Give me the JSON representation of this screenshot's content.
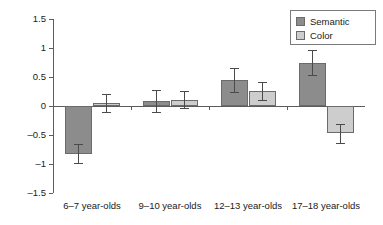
{
  "chart_data": {
    "type": "bar",
    "title": "",
    "xlabel": "",
    "ylabel": "Z scores",
    "ylim": [
      -1.5,
      1.5
    ],
    "ytick_labels": [
      "1.5",
      "1",
      "0.5",
      "0",
      "-0.5",
      "-1",
      "-1.5"
    ],
    "ytick_values": [
      1.5,
      1,
      0.5,
      0,
      -0.5,
      -1,
      -1.5
    ],
    "grid": false,
    "legend_position": "top-right",
    "categories": [
      "6–7 year-olds",
      "9–10 year-olds",
      "12–13 year-olds",
      "17–18 year-olds"
    ],
    "series": [
      {
        "name": "Semantic",
        "color": "#8c8c8c",
        "values": [
          -0.82,
          0.09,
          0.45,
          0.75
        ],
        "errors": [
          0.16,
          0.19,
          0.21,
          0.21
        ]
      },
      {
        "name": "Color",
        "color": "#cdcdcd",
        "values": [
          0.05,
          0.11,
          0.26,
          -0.47
        ],
        "errors": [
          0.16,
          0.15,
          0.16,
          0.16
        ]
      }
    ]
  },
  "legend": {
    "items": [
      {
        "label": "Semantic",
        "swatch": "semantic"
      },
      {
        "label": "Color",
        "swatch": "color"
      }
    ]
  },
  "axes": {
    "y_title": "Z scores"
  }
}
